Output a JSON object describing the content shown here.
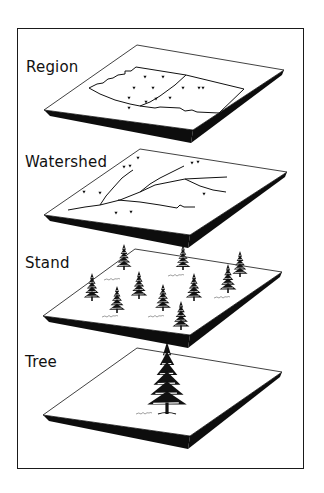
{
  "diagram": {
    "title": "",
    "colors": {
      "ink": "#111111",
      "background": "#ffffff",
      "slab": "#0d0d0d"
    },
    "levels": [
      {
        "label": "Region",
        "label_pos": [
          26,
          58
        ],
        "plane": {
          "top": [
            137,
            45
          ],
          "right": [
            284,
            70
          ],
          "bottom": [
            193,
            130
          ],
          "left": [
            44,
            110
          ],
          "thickness": 13
        },
        "content": "region-map",
        "outline": [
          [
            89,
            88
          ],
          [
            97,
            84
          ],
          [
            103,
            83
          ],
          [
            108,
            79
          ],
          [
            113,
            78
          ],
          [
            118,
            75
          ],
          [
            125,
            74
          ],
          [
            125,
            71
          ],
          [
            131,
            71
          ],
          [
            136,
            67
          ],
          [
            186,
            75
          ],
          [
            244,
            89
          ],
          [
            219,
            113
          ],
          [
            197,
            112
          ],
          [
            192,
            110
          ],
          [
            185,
            111
          ],
          [
            180,
            108
          ],
          [
            160,
            107
          ],
          [
            155,
            108
          ],
          [
            140,
            106
          ],
          [
            130,
            104
          ],
          [
            115,
            100
          ],
          [
            100,
            94
          ]
        ],
        "divider": [
          [
            186,
            75
          ],
          [
            175,
            85
          ],
          [
            160,
            96
          ],
          [
            150,
            102
          ],
          [
            140,
            106
          ]
        ],
        "markers": [
          [
            145,
            77
          ],
          [
            163,
            77
          ],
          [
            134,
            88
          ],
          [
            153,
            88
          ],
          [
            183,
            88
          ],
          [
            199,
            88
          ],
          [
            203,
            88
          ],
          [
            129,
            98
          ],
          [
            156,
            99
          ],
          [
            146,
            102
          ],
          [
            170,
            98
          ],
          [
            129,
            108
          ]
        ]
      },
      {
        "label": "Watershed",
        "label_pos": [
          25,
          153
        ],
        "plane": {
          "top": [
            140,
            149
          ],
          "right": [
            287,
            172
          ],
          "bottom": [
            190,
            235
          ],
          "left": [
            44,
            215
          ],
          "thickness": 13
        },
        "content": "streams",
        "streams": [
          [
            [
              68,
              210
            ],
            [
              85,
              207
            ],
            [
              100,
              205
            ],
            [
              120,
              200
            ],
            [
              140,
              192
            ],
            [
              155,
              185
            ],
            [
              185,
              179
            ],
            [
              205,
              178
            ],
            [
              227,
              177
            ]
          ],
          [
            [
              100,
              205
            ],
            [
              106,
              196
            ],
            [
              113,
              188
            ],
            [
              122,
              178
            ],
            [
              130,
              172
            ],
            [
              133,
              170
            ]
          ],
          [
            [
              140,
              192
            ],
            [
              150,
              184
            ],
            [
              160,
              178
            ],
            [
              172,
              172
            ],
            [
              184,
              166
            ]
          ],
          [
            [
              118,
              200
            ],
            [
              140,
              202
            ],
            [
              160,
              205
            ],
            [
              177,
              208
            ],
            [
              180,
              205
            ],
            [
              184,
              207
            ],
            [
              195,
              207
            ]
          ],
          [
            [
              185,
              179
            ],
            [
              200,
              186
            ],
            [
              213,
              190
            ],
            [
              226,
              192
            ]
          ]
        ],
        "markers": [
          [
            138,
            158
          ],
          [
            124,
            167
          ],
          [
            130,
            166
          ],
          [
            192,
            163
          ],
          [
            198,
            162
          ],
          [
            84,
            192
          ],
          [
            100,
            193
          ],
          [
            116,
            213
          ],
          [
            131,
            212
          ],
          [
            204,
            194
          ]
        ]
      },
      {
        "label": "Stand",
        "label_pos": [
          25,
          254
        ],
        "plane": {
          "top": [
            135,
            249
          ],
          "right": [
            282,
            272
          ],
          "bottom": [
            190,
            335
          ],
          "left": [
            43,
            316
          ],
          "thickness": 13
        },
        "content": "tree-stand",
        "trees": [
          {
            "x": 124,
            "top": 244,
            "base": 270
          },
          {
            "x": 183,
            "top": 245,
            "base": 270
          },
          {
            "x": 240,
            "top": 251,
            "base": 277
          },
          {
            "x": 92,
            "top": 273,
            "base": 301
          },
          {
            "x": 139,
            "top": 271,
            "base": 299
          },
          {
            "x": 194,
            "top": 273,
            "base": 301
          },
          {
            "x": 228,
            "top": 264,
            "base": 293
          },
          {
            "x": 117,
            "top": 286,
            "base": 313
          },
          {
            "x": 163,
            "top": 284,
            "base": 311
          },
          {
            "x": 181,
            "top": 301,
            "base": 330
          }
        ],
        "shrubs": [
          [
            104,
            280
          ],
          [
            168,
            276
          ],
          [
            102,
            317
          ],
          [
            148,
            317
          ],
          [
            214,
            298
          ]
        ]
      },
      {
        "label": "Tree",
        "label_pos": [
          25,
          353
        ],
        "plane": {
          "top": [
            137,
            348
          ],
          "right": [
            282,
            372
          ],
          "bottom": [
            190,
            436
          ],
          "left": [
            43,
            415
          ],
          "thickness": 13
        },
        "content": "single-tree",
        "tree": {
          "x": 167,
          "top": 342,
          "base": 414
        },
        "shrubs": [
          [
            136,
            414
          ]
        ]
      }
    ]
  }
}
